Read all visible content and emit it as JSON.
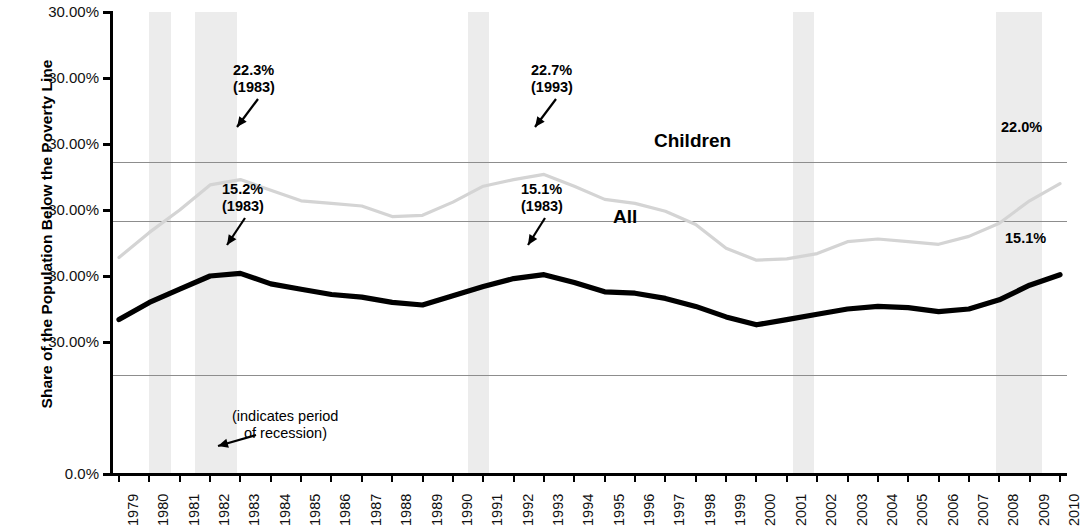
{
  "chart_data": {
    "type": "line",
    "title": "",
    "xlabel": "",
    "ylabel": "Share of the Population Below the Poverty Line",
    "x": [
      1979,
      1980,
      1981,
      1982,
      1983,
      1984,
      1985,
      1986,
      1987,
      1988,
      1989,
      1990,
      1991,
      1992,
      1993,
      1994,
      1995,
      1996,
      1997,
      1998,
      1999,
      2000,
      2001,
      2002,
      2003,
      2004,
      2005,
      2006,
      2007,
      2008,
      2009,
      2010
    ],
    "categories": [
      "1979",
      "1980",
      "1981",
      "1982",
      "1983",
      "1984",
      "1985",
      "1986",
      "1987",
      "1988",
      "1989",
      "1990",
      "1991",
      "1992",
      "1993",
      "1994",
      "1995",
      "1996",
      "1997",
      "1998",
      "1999",
      "2000",
      "2001",
      "2002",
      "2003",
      "2004",
      "2005",
      "2006",
      "2007",
      "2008",
      "2009",
      "2010"
    ],
    "series": [
      {
        "name": "Children",
        "color": "#d4d4d4",
        "values": [
          16.4,
          18.3,
          20.0,
          21.9,
          22.3,
          21.5,
          20.7,
          20.5,
          20.3,
          19.5,
          19.6,
          20.6,
          21.8,
          22.3,
          22.7,
          21.8,
          20.8,
          20.5,
          19.9,
          18.9,
          17.1,
          16.2,
          16.3,
          16.7,
          17.6,
          17.8,
          17.6,
          17.4,
          18.0,
          19.0,
          20.7,
          22.0
        ]
      },
      {
        "name": "All",
        "color": "#000000",
        "values": [
          11.7,
          13.0,
          14.0,
          15.0,
          15.2,
          14.4,
          14.0,
          13.6,
          13.4,
          13.0,
          12.8,
          13.5,
          14.2,
          14.8,
          15.1,
          14.5,
          13.8,
          13.7,
          13.3,
          12.7,
          11.9,
          11.3,
          11.7,
          12.1,
          12.5,
          12.7,
          12.6,
          12.3,
          12.5,
          13.2,
          14.3,
          15.1
        ]
      }
    ],
    "ylim": [
      0,
      35
    ],
    "y_ticks": [
      {
        "label": "30.00%",
        "value": 35
      },
      {
        "label": "30.00%",
        "value": 30
      },
      {
        "label": "30.00%",
        "value": 25
      },
      {
        "label": "30.00%",
        "value": 20
      },
      {
        "label": "30.00%",
        "value": 15
      },
      {
        "label": "30.00%",
        "value": 10
      },
      {
        "label": "0.0%",
        "value": 0
      }
    ],
    "gridlines": [
      23.6,
      19.2,
      7.5
    ],
    "grid": true,
    "legend_position": "inline-labels",
    "recession_bands": [
      {
        "start": 1980.0,
        "end": 1980.7
      },
      {
        "start": 1981.5,
        "end": 1982.9
      },
      {
        "start": 1990.5,
        "end": 1991.2
      },
      {
        "start": 2001.2,
        "end": 2001.9
      },
      {
        "start": 2007.9,
        "end": 2009.4
      }
    ],
    "annotations": [
      {
        "name": "children-peak-1983",
        "value": "22.3%",
        "year": "(1983)"
      },
      {
        "name": "children-peak-1993",
        "value": "22.7%",
        "year": "(1993)"
      },
      {
        "name": "all-peak-1983",
        "value": "15.2%",
        "year": "(1983)"
      },
      {
        "name": "all-peak-1993",
        "value": "15.1%",
        "year": "(1983)"
      }
    ],
    "series_labels": [
      {
        "name": "children-series-label",
        "text": "Children"
      },
      {
        "name": "all-series-label",
        "text": "All"
      }
    ],
    "end_labels": [
      {
        "name": "children-end-label",
        "text": "22.0%"
      },
      {
        "name": "all-end-label",
        "text": "15.1%"
      }
    ],
    "recession_note": {
      "line1": "(indicates period",
      "line2": "of recession)"
    }
  }
}
